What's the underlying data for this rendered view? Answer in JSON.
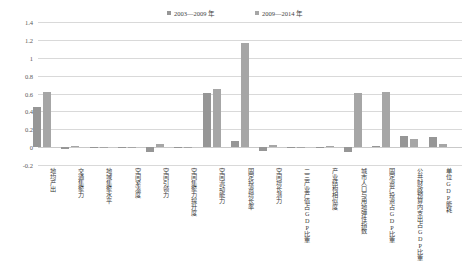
{
  "chart_data": {
    "type": "bar",
    "title": "",
    "xlabel": "",
    "ylabel": "",
    "ylim": [
      -0.2,
      1.4
    ],
    "ystep": 0.2,
    "grid": true,
    "legend_position": "top-center",
    "yticks": [
      "1.4",
      "1.2",
      "1",
      "0.8",
      "0.6",
      "0.4",
      "0.2",
      "0",
      "-0.2"
    ],
    "categories": [
      "地均产出",
      "交通集聚力",
      "地域集聚水平",
      "空间紧凑度",
      "空间引领力",
      "空间集聚力提升度",
      "空间流动能力",
      "固定投资增长率",
      "空间增长潜力",
      "二三产业产值占GDP比重",
      "产业结构相似度",
      "城市人口与用地弹性指数",
      "固定资产投资占GDP比重",
      "公共财政预算内支出占GDP比重",
      "单位GDP能耗"
    ],
    "series": [
      {
        "name": "2003—2009 年",
        "color": "#969696",
        "values": [
          0.45,
          -0.02,
          -0.01,
          0.0,
          -0.05,
          0.0,
          0.61,
          0.07,
          -0.04,
          0.005,
          0.005,
          -0.05,
          0.01,
          0.12,
          0.11
        ]
      },
      {
        "name": "2009—2014 年",
        "color": "#a6a6a6",
        "values": [
          0.62,
          0.01,
          0.0,
          0.005,
          0.035,
          0.0,
          0.65,
          1.17,
          0.02,
          0.005,
          0.01,
          0.61,
          0.62,
          0.09,
          0.03
        ]
      }
    ]
  },
  "colors": {
    "gridline": "#d9d9d9",
    "axis_text": "#595959",
    "label_text": "#3a3a3a",
    "background": "#ffffff"
  }
}
